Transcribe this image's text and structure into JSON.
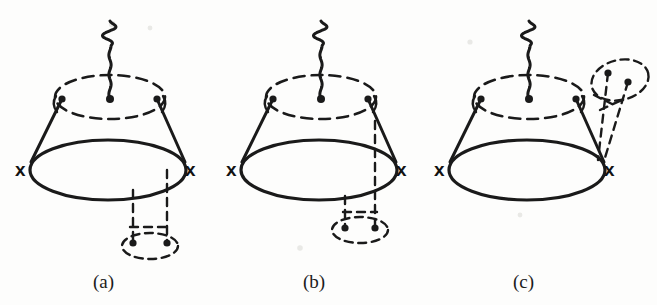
{
  "figure": {
    "background_color": "#fdfdfc",
    "ink_color": "#1a1a1a",
    "width": 657,
    "height": 305
  },
  "captions": [
    {
      "label": "(a)",
      "x": 93,
      "y": 288
    },
    {
      "label": "(b)",
      "x": 303,
      "y": 288
    },
    {
      "label": "(c)",
      "x": 513,
      "y": 288
    }
  ],
  "panels": [
    {
      "id": "a",
      "caption": "(a)",
      "cross_labels": [
        {
          "text": "x",
          "x": 15,
          "y": 176
        },
        {
          "text": "x",
          "x": 185,
          "y": 176
        }
      ],
      "solid_loop": {
        "cx": 108,
        "cy": 170,
        "rx": 78,
        "ry": 30
      },
      "top_dashed_loop": {
        "cx": 110,
        "cy": 97,
        "rx": 55,
        "ry": 22
      },
      "legs": [
        {
          "x1": 31,
          "y1": 162,
          "x2": 62,
          "y2": 99
        },
        {
          "x1": 185,
          "y1": 162,
          "x2": 157,
          "y2": 99
        }
      ],
      "vertex_dots": [
        {
          "cx": 62,
          "cy": 99,
          "r": 3.6
        },
        {
          "cx": 157,
          "cy": 99,
          "r": 3.6
        }
      ],
      "hooks": [
        {
          "path": "M 56 96 q -5 8 1 16"
        },
        {
          "path": "M 163 96 q 5 8 -1 16"
        }
      ],
      "wavy_line": {
        "x": 110,
        "y_top": 21,
        "y_bottom": 99,
        "amplitude": 7.5,
        "waves": 4.0,
        "end_dot": {
          "cx": 110,
          "cy": 99,
          "r": 4.0
        }
      },
      "quark_loop": {
        "ellipse": {
          "cx": 150,
          "cy": 246,
          "rx": 28,
          "ry": 13
        },
        "legs": [
          {
            "x1": 133,
            "y1": 190,
            "x2": 133,
            "y2": 243
          },
          {
            "x1": 167,
            "y1": 170,
            "x2": 167,
            "y2": 243
          }
        ],
        "dots": [
          {
            "cx": 133,
            "cy": 243,
            "r": 3.6
          },
          {
            "cx": 167,
            "cy": 243,
            "r": 3.6
          }
        ],
        "connector": {
          "x1": 130,
          "y1": 227,
          "x2": 168,
          "y2": 227
        }
      }
    },
    {
      "id": "b",
      "caption": "(b)",
      "cross_labels": [
        {
          "text": "x",
          "x": 226,
          "y": 176
        },
        {
          "text": "x",
          "x": 396,
          "y": 176
        }
      ],
      "solid_loop": {
        "cx": 319,
        "cy": 170,
        "rx": 78,
        "ry": 30
      },
      "top_dashed_loop": {
        "cx": 321,
        "cy": 97,
        "rx": 55,
        "ry": 22
      },
      "legs": [
        {
          "x1": 242,
          "y1": 162,
          "x2": 273,
          "y2": 99
        },
        {
          "x1": 396,
          "y1": 162,
          "x2": 368,
          "y2": 99
        }
      ],
      "vertex_dots": [
        {
          "cx": 273,
          "cy": 99,
          "r": 3.6
        },
        {
          "cx": 368,
          "cy": 99,
          "r": 3.6
        }
      ],
      "hooks": [
        {
          "path": "M 267 96 q -5 8 1 16"
        },
        {
          "path": "M 374 96 q 5 8 -1 16"
        }
      ],
      "wavy_line": {
        "x": 321,
        "y_top": 21,
        "y_bottom": 99,
        "amplitude": 7.5,
        "waves": 4.0,
        "end_dot": {
          "cx": 321,
          "cy": 99,
          "r": 4.0
        }
      },
      "quark_loop": {
        "ellipse": {
          "cx": 360,
          "cy": 230,
          "rx": 28,
          "ry": 13
        },
        "legs": [
          {
            "x1": 345,
            "y1": 196,
            "x2": 345,
            "y2": 228
          },
          {
            "x1": 375,
            "y1": 121,
            "x2": 375,
            "y2": 228
          }
        ],
        "dots": [
          {
            "cx": 345,
            "cy": 228,
            "r": 3.6
          },
          {
            "cx": 375,
            "cy": 228,
            "r": 3.6
          }
        ],
        "connector": {
          "x1": 343,
          "y1": 212,
          "x2": 377,
          "y2": 212
        }
      }
    },
    {
      "id": "c",
      "caption": "(c)",
      "cross_labels": [
        {
          "text": "x",
          "x": 434,
          "y": 176
        },
        {
          "text": "x",
          "x": 604,
          "y": 176
        }
      ],
      "solid_loop": {
        "cx": 527,
        "cy": 170,
        "rx": 78,
        "ry": 30
      },
      "top_dashed_loop": {
        "cx": 529,
        "cy": 97,
        "rx": 55,
        "ry": 22
      },
      "legs": [
        {
          "x1": 450,
          "y1": 162,
          "x2": 481,
          "y2": 99
        },
        {
          "x1": 604,
          "y1": 162,
          "x2": 576,
          "y2": 99
        }
      ],
      "vertex_dots": [
        {
          "cx": 481,
          "cy": 99,
          "r": 3.6
        },
        {
          "cx": 576,
          "cy": 99,
          "r": 3.6
        }
      ],
      "hooks": [
        {
          "path": "M 475 96 q -5 8 1 16"
        },
        {
          "path": "M 582 96 q 5 8 -1 16"
        }
      ],
      "wavy_line": {
        "x": 529,
        "y_top": 21,
        "y_bottom": 99,
        "amplitude": 7.5,
        "waves": 4.0,
        "end_dot": {
          "cx": 529,
          "cy": 99,
          "r": 4.0
        }
      },
      "side_quark_loop": {
        "ellipse": {
          "cx": 620,
          "cy": 80,
          "rx": 29,
          "ry": 20,
          "rotate": -14
        },
        "legs": [
          {
            "x1": 608,
            "y1": 73,
            "x2": 598,
            "y2": 160
          },
          {
            "x1": 628,
            "y1": 82,
            "x2": 604,
            "y2": 161
          }
        ],
        "dots": [
          {
            "cx": 608,
            "cy": 73,
            "r": 3.6
          },
          {
            "cx": 628,
            "cy": 82,
            "r": 3.6
          }
        ],
        "connectors": [
          {
            "x1": 594,
            "y1": 95,
            "x2": 612,
            "y2": 104
          },
          {
            "x1": 600,
            "y1": 110,
            "x2": 622,
            "y2": 100
          }
        ]
      }
    }
  ],
  "specks": [
    {
      "cx": 112,
      "cy": 24,
      "r": 3.2
    },
    {
      "cx": 150,
      "cy": 28,
      "r": 2.4
    },
    {
      "cx": 470,
      "cy": 42,
      "r": 2.6
    },
    {
      "cx": 300,
      "cy": 248,
      "r": 2.8
    },
    {
      "cx": 520,
      "cy": 215,
      "r": 2.4
    }
  ]
}
